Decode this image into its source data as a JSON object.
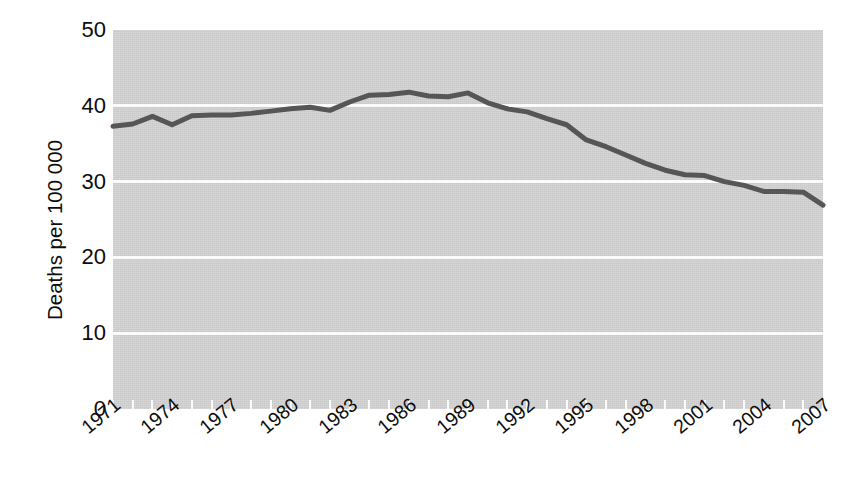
{
  "figure": {
    "caption_top": "",
    "caption_bottom": ""
  },
  "chart_data": {
    "type": "line",
    "title": "",
    "xlabel": "",
    "ylabel": "Deaths per 100 000",
    "ylim": [
      0,
      50
    ],
    "xlim": [
      1971,
      2007
    ],
    "grid": true,
    "gridlines": [
      10,
      20,
      30,
      40
    ],
    "legend": "none",
    "y_ticks": [
      50,
      40,
      30,
      20,
      10,
      0
    ],
    "y_tick_labels": [
      "50",
      "40",
      "30",
      "20",
      "10",
      "0"
    ],
    "x_tick_labels": [
      "1971",
      "1974",
      "1977",
      "1980",
      "1983",
      "1986",
      "1989",
      "1992",
      "1995",
      "1998",
      "2001",
      "2004",
      "2007"
    ],
    "x_tick_step_years": 3,
    "x_minor_tick_step_years": 1,
    "colors": {
      "line": "#565656",
      "plot_background": "#c9c9c9",
      "gridline": "#fbfbfb",
      "text": "#0d0d0d",
      "page_background": "#ffffff"
    },
    "line_width_px": 5,
    "x": [
      1971,
      1972,
      1973,
      1974,
      1975,
      1976,
      1977,
      1978,
      1979,
      1980,
      1981,
      1982,
      1983,
      1984,
      1985,
      1986,
      1987,
      1988,
      1989,
      1990,
      1991,
      1992,
      1993,
      1994,
      1995,
      1996,
      1997,
      1998,
      1999,
      2000,
      2001,
      2002,
      2003,
      2004,
      2005,
      2006,
      2007
    ],
    "series": [
      {
        "name": "Deaths per 100 000",
        "values": [
          37.3,
          37.6,
          38.6,
          37.5,
          38.7,
          38.8,
          38.8,
          39.0,
          39.3,
          39.6,
          39.8,
          39.4,
          40.5,
          41.4,
          41.5,
          41.8,
          41.3,
          41.2,
          41.7,
          40.4,
          39.6,
          39.2,
          38.3,
          37.5,
          35.5,
          34.6,
          33.5,
          32.4,
          31.5,
          30.9,
          30.8,
          30.0,
          29.5,
          28.7,
          28.7,
          28.6,
          26.9
        ]
      }
    ]
  }
}
